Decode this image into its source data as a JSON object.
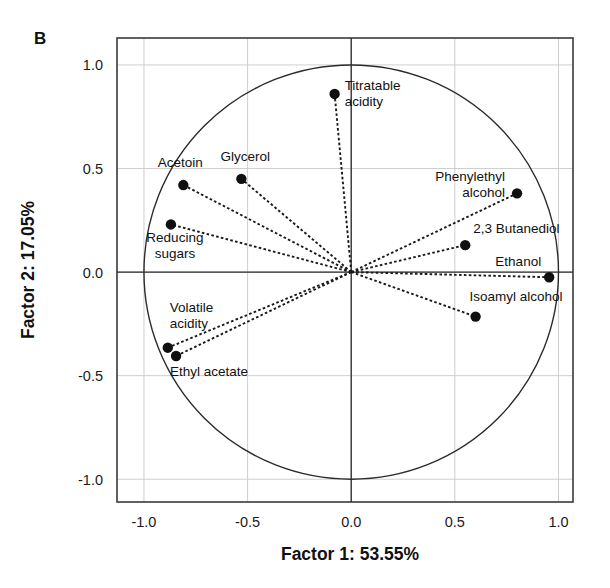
{
  "figure": {
    "panel_label": "B",
    "background": "#ffffff",
    "foreground": "#111111"
  },
  "chart_data": {
    "type": "scatter",
    "title": "",
    "subtitle": "",
    "xlabel": "Factor 1: 53.55%",
    "ylabel": "Factor 2: 17.05%",
    "xlim": [
      -1.13,
      1.07
    ],
    "ylim": [
      -1.11,
      1.13
    ],
    "xticks": [
      -1.0,
      -0.5,
      0.0,
      0.5,
      1.0
    ],
    "xticklabels": [
      "-1.0",
      "-0.5",
      "0.0",
      "0.5",
      "1.0"
    ],
    "yticks": [
      -1.0,
      -0.5,
      0.0,
      0.5,
      1.0
    ],
    "yticklabels": [
      "-1.0",
      "-0.5",
      "0.0",
      "0.5",
      "1.0"
    ],
    "grid": true,
    "legend": "none",
    "unit_circle": true,
    "unit_circle_radius": 1.0,
    "origin_cross": true,
    "annotations": [
      {
        "label": "Titratable acidity",
        "label_lines": [
          "Titratable",
          "acidity"
        ],
        "x": -0.08,
        "y": 0.86,
        "label_anchor": "start",
        "label_dx": 10,
        "label_dy": -4
      },
      {
        "label": "Acetoin",
        "label_lines": [
          "Acetoin"
        ],
        "x": -0.81,
        "y": 0.42,
        "label_anchor": "middle",
        "label_dx": -3,
        "label_dy": -18
      },
      {
        "label": "Glycerol",
        "label_lines": [
          "Glycerol"
        ],
        "x": -0.53,
        "y": 0.45,
        "label_anchor": "middle",
        "label_dx": 4,
        "label_dy": -18
      },
      {
        "label": "Reducing sugars",
        "label_lines": [
          "Reducing",
          "sugars"
        ],
        "x": -0.87,
        "y": 0.23,
        "label_anchor": "middle",
        "label_dx": 4,
        "label_dy": 18
      },
      {
        "label": "Phenylethyl alcohol",
        "label_lines": [
          "Phenylethyl",
          "alcohol"
        ],
        "x": 0.8,
        "y": 0.38,
        "label_anchor": "end",
        "label_dx": -12,
        "label_dy": -12
      },
      {
        "label": "2,3 Butanediol",
        "label_lines": [
          "2,3 Butanediol"
        ],
        "x": 0.55,
        "y": 0.13,
        "label_anchor": "start",
        "label_dx": 8,
        "label_dy": -12
      },
      {
        "label": "Ethanol",
        "label_lines": [
          "Ethanol"
        ],
        "x": 0.955,
        "y": -0.025,
        "label_anchor": "end",
        "label_dx": -8,
        "label_dy": -11
      },
      {
        "label": "Isoamyl alcohol",
        "label_lines": [
          "Isoamyl alcohol"
        ],
        "x": 0.6,
        "y": -0.215,
        "label_anchor": "start",
        "label_dx": -6,
        "label_dy": -16
      },
      {
        "label": "Volatile acidity",
        "label_lines": [
          "Volatile",
          "acidity"
        ],
        "x": -0.885,
        "y": -0.365,
        "label_anchor": "start",
        "label_dx": 2,
        "label_dy": -36
      },
      {
        "label": "Ethyl acetate",
        "label_lines": [
          "Ethyl acetate"
        ],
        "x": -0.845,
        "y": -0.405,
        "label_anchor": "start",
        "label_dx": -6,
        "label_dy": 20
      }
    ]
  }
}
